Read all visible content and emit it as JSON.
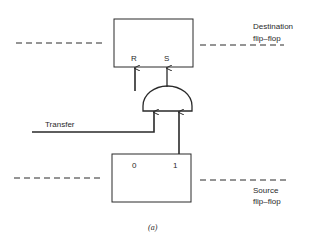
{
  "diagram": {
    "destination": {
      "label_line1": "Destination",
      "label_line2": "flip–flop",
      "input_r": "R",
      "input_s": "S"
    },
    "source": {
      "label_line1": "Source",
      "label_line2": "flip–flop",
      "output_0": "0",
      "output_1": "1"
    },
    "gate": {
      "type": "AND"
    },
    "transfer_label": "Transfer",
    "caption": "(a)",
    "colors": {
      "line": "#2a2a2a",
      "background": "#ffffff"
    }
  }
}
